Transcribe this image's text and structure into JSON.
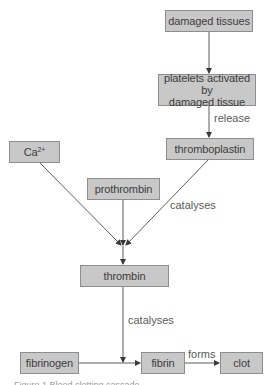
{
  "diagram": {
    "type": "flowchart",
    "title": "Blood clotting cascade",
    "nodes": {
      "damaged_tissues": "damaged tissues",
      "platelets": "platelets activated by damaged tissue",
      "platelets_line1": "platelets activated by",
      "platelets_line2": "damaged tissue",
      "thromboplastin": "thromboplastin",
      "calcium_base": "Ca",
      "calcium_sup": "2+",
      "prothrombin": "prothrombin",
      "thrombin": "thrombin",
      "fibrinogen": "fibrinogen",
      "fibrin": "fibrin",
      "clot": "clot"
    },
    "edge_labels": {
      "release": "release",
      "catalyses_1": "catalyses",
      "catalyses_2": "catalyses",
      "forms": "forms"
    },
    "edges": [
      {
        "from": "damaged tissues",
        "to": "platelets activated by damaged tissue",
        "label": ""
      },
      {
        "from": "platelets activated by damaged tissue",
        "to": "thromboplastin",
        "label": "release"
      },
      {
        "from": "Ca2+",
        "to": "thrombin",
        "label": ""
      },
      {
        "from": "prothrombin",
        "to": "thrombin",
        "label": ""
      },
      {
        "from": "thromboplastin",
        "to": "thrombin",
        "label": "catalyses"
      },
      {
        "from": "thrombin",
        "to": "fibrinogen→fibrin",
        "label": "catalyses"
      },
      {
        "from": "fibrinogen",
        "to": "fibrin",
        "label": ""
      },
      {
        "from": "fibrin",
        "to": "clot",
        "label": "forms"
      }
    ],
    "colors": {
      "box_fill": "#c8c8c8",
      "box_border": "#8e8e8e",
      "arrow": "#4a4a4a",
      "text": "#3c3c3c"
    },
    "caption": "Figure 1 Blood clotting cascade"
  }
}
